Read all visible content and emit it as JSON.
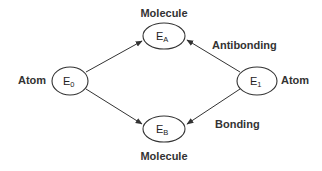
{
  "diagram": {
    "type": "molecular-orbital-energy-diagram",
    "nodes": [
      {
        "id": "E0",
        "main": "E",
        "sub": "0",
        "label": "Atom",
        "label_position": "left"
      },
      {
        "id": "EA",
        "main": "E",
        "sub": "A",
        "label": "Molecule",
        "label_position": "top"
      },
      {
        "id": "E1",
        "main": "E",
        "sub": "1",
        "label": "Atom",
        "label_position": "right"
      },
      {
        "id": "EB",
        "main": "E",
        "sub": "B",
        "label": "Molecule",
        "label_position": "bottom"
      }
    ],
    "edges": [
      {
        "from": "E0",
        "to": "EA"
      },
      {
        "from": "E0",
        "to": "EB"
      },
      {
        "from": "E1",
        "to": "EA"
      },
      {
        "from": "E1",
        "to": "EB"
      }
    ],
    "annotations": {
      "antibonding": "Antibonding",
      "bonding": "Bonding"
    },
    "colors": {
      "stroke": "#333333",
      "text": "#333333",
      "background": "#ffffff"
    }
  }
}
